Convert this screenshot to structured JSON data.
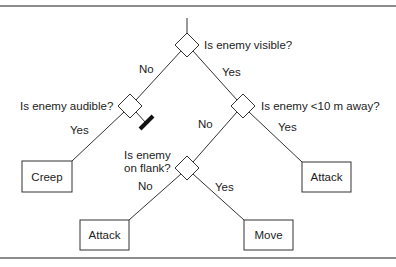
{
  "diagram": {
    "type": "decision-tree",
    "colors": {
      "line": "#333333",
      "text": "#222222",
      "background": "#ffffff",
      "frame": "#555555"
    },
    "decisions": {
      "root": "Is enemy visible?",
      "audible": "Is enemy audible?",
      "near": "Is enemy <10 m away?",
      "flank_line1": "Is enemy",
      "flank_line2": "on flank?"
    },
    "edges": {
      "root_no": "No",
      "root_yes": "Yes",
      "audible_yes": "Yes",
      "near_no": "No",
      "near_yes": "Yes",
      "flank_no": "No",
      "flank_yes": "Yes"
    },
    "actions": {
      "creep": "Creep",
      "attack_near": "Attack",
      "attack_flank_no": "Attack",
      "move": "Move"
    }
  }
}
